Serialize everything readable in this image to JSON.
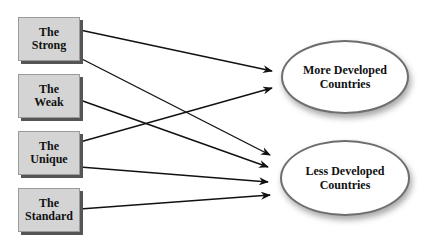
{
  "diagram": {
    "sources": [
      {
        "id": "strong",
        "line1": "The",
        "line2": "Strong"
      },
      {
        "id": "weak",
        "line1": "The",
        "line2": "Weak"
      },
      {
        "id": "unique",
        "line1": "The",
        "line2": "Unique"
      },
      {
        "id": "standard",
        "line1": "The",
        "line2": "Standard"
      }
    ],
    "targets": [
      {
        "id": "mdc",
        "line1": "More Developed",
        "line2": "Countries"
      },
      {
        "id": "ldc",
        "line1": "Less Developed",
        "line2": "Countries"
      }
    ],
    "edges": [
      {
        "from": "strong",
        "to": "mdc"
      },
      {
        "from": "strong",
        "to": "ldc"
      },
      {
        "from": "weak",
        "to": "ldc"
      },
      {
        "from": "unique",
        "to": "mdc"
      },
      {
        "from": "unique",
        "to": "ldc"
      },
      {
        "from": "standard",
        "to": "ldc"
      }
    ]
  }
}
